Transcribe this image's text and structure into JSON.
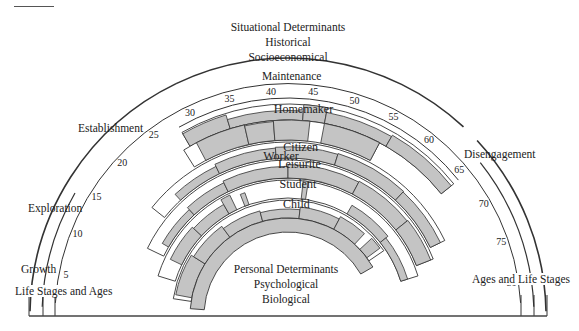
{
  "figure": {
    "situational": [
      "Situational Determinants",
      "Historical",
      "Socioeconomical"
    ],
    "personal": [
      "Personal Determinants",
      "Psychological",
      "Biological"
    ],
    "left_caption": "Life Stages and Ages",
    "right_caption": "Ages and Life Stages",
    "stages": {
      "growth": "Growth",
      "exploration": "Exploration",
      "establishment": "Establishment",
      "maintenance": "Maintenance",
      "disengagement": "Disengagement"
    },
    "age_ticks": [
      "5",
      "10",
      "15",
      "20",
      "25",
      "30",
      "35",
      "40",
      "45",
      "50",
      "55",
      "60",
      "65",
      "70",
      "75",
      "80"
    ],
    "roles": [
      "Homemaker",
      "Worker",
      "Citizen",
      "Leisurite",
      "Student",
      "Child"
    ],
    "colors": {
      "band_fill": "#c4c4c4",
      "line": "#333333",
      "background": "#ffffff"
    }
  }
}
